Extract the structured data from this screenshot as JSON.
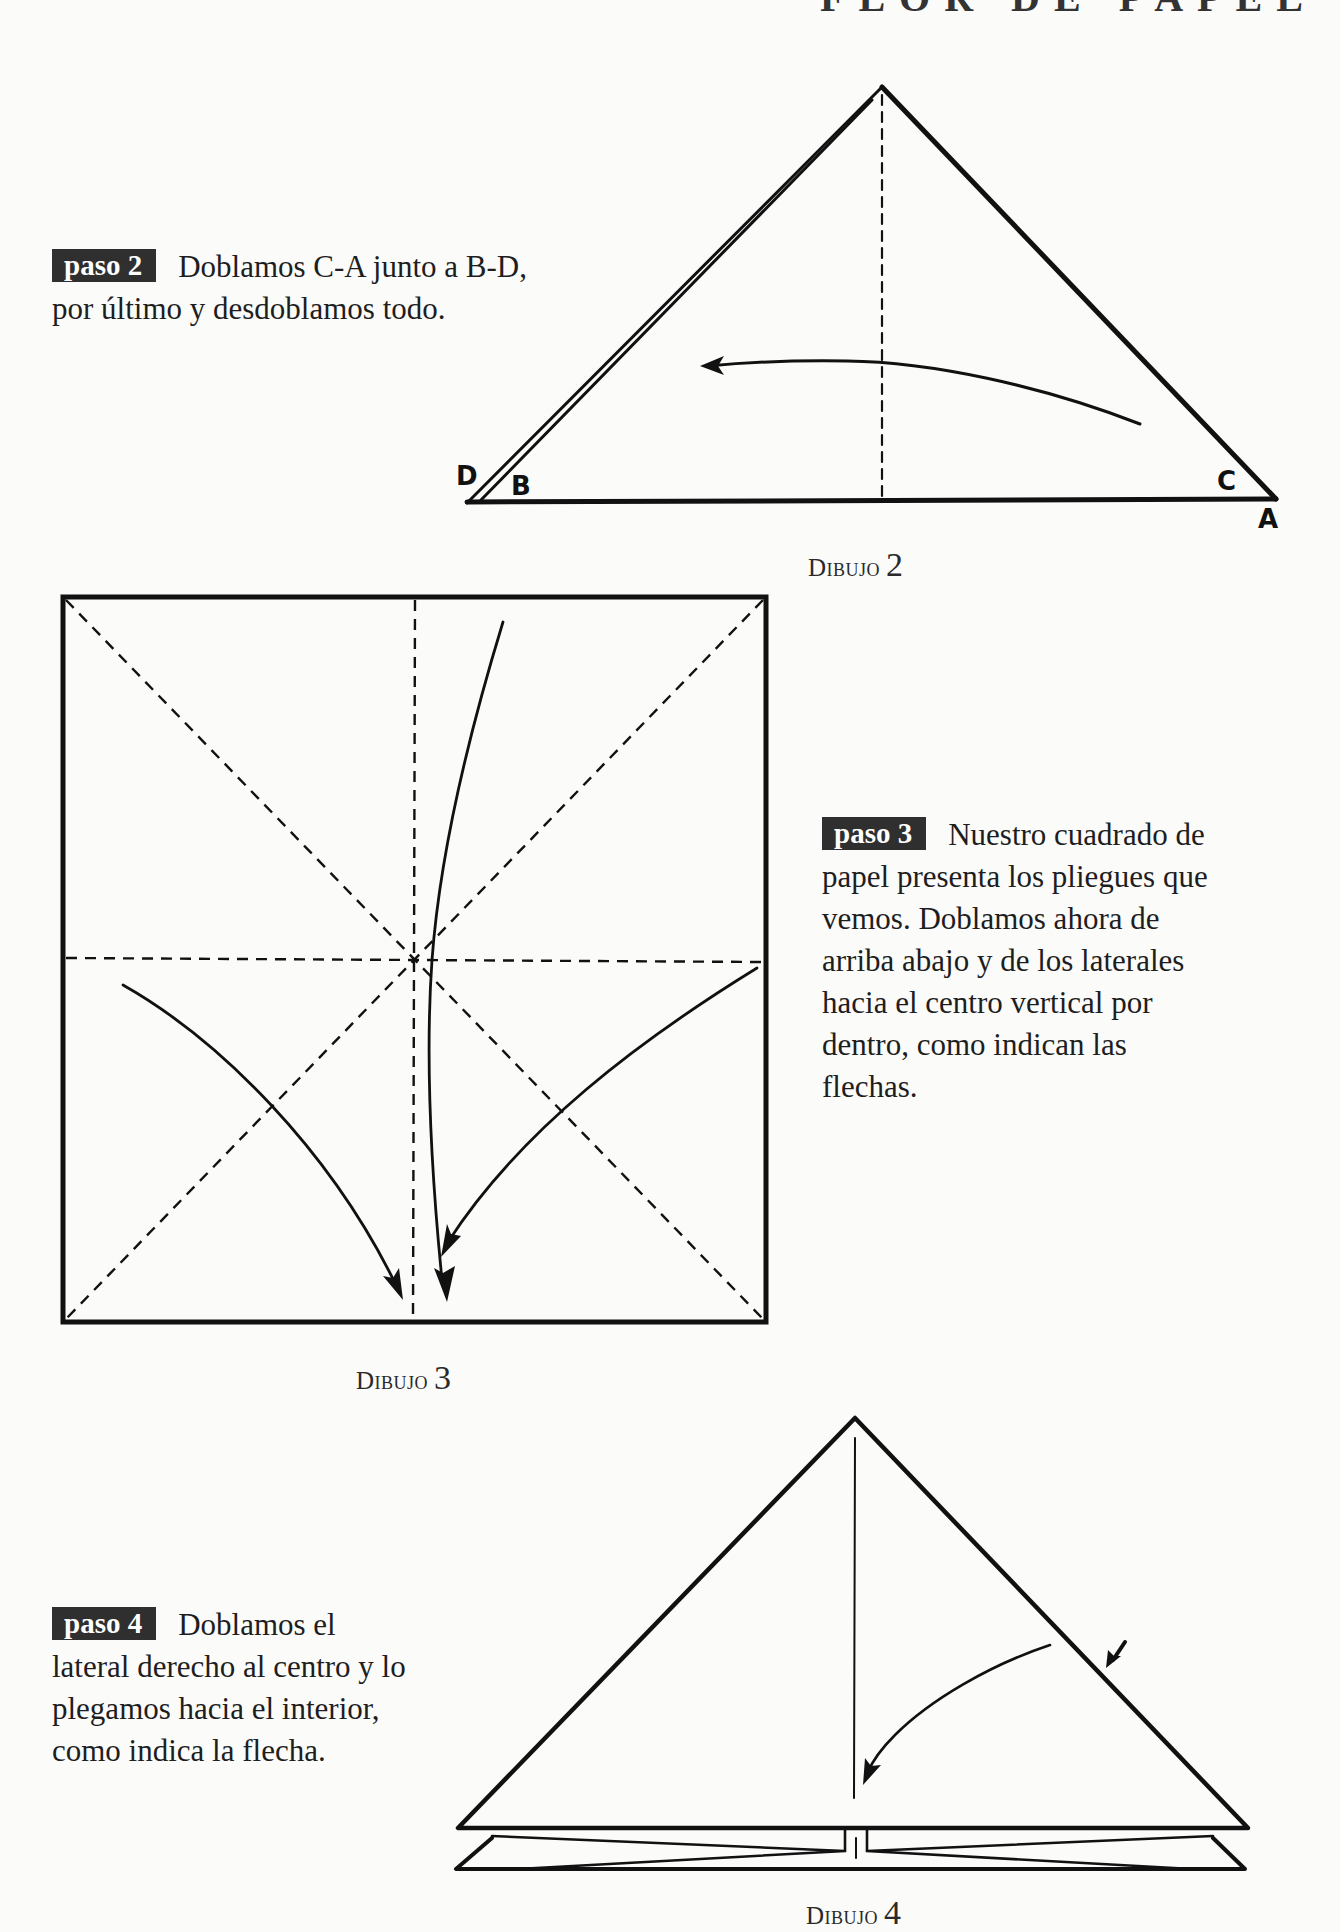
{
  "header": {
    "title": "FLOR DE PAPEL"
  },
  "steps": [
    {
      "badge": "paso 2",
      "lines": [
        "Doblamos C-A junto a B-D,",
        "por último y desdoblamos todo."
      ]
    },
    {
      "badge": "paso 3",
      "lines": [
        "Nuestro cuadrado de",
        "papel presenta los pliegues que",
        "vemos. Doblamos ahora de",
        "arriba abajo y de los laterales",
        "hacia el centro vertical por",
        "dentro, como indican las",
        "flechas."
      ]
    },
    {
      "badge": "paso 4",
      "lines": [
        "Doblamos el",
        "lateral derecho al centro y lo",
        "plegamos hacia el interior,",
        "como indica la flecha."
      ]
    }
  ],
  "captions": [
    {
      "word": "Dibujo",
      "num": "2"
    },
    {
      "word": "Dibujo",
      "num": "3"
    },
    {
      "word": "Dibujo",
      "num": "4"
    }
  ],
  "diagram2": {
    "corner_labels": {
      "D": "D",
      "B": "B",
      "C": "C",
      "A": "A"
    }
  },
  "colors": {
    "ink": "#111111",
    "badge_bg": "#2f2f2f",
    "paper": "#fbfbfa"
  }
}
